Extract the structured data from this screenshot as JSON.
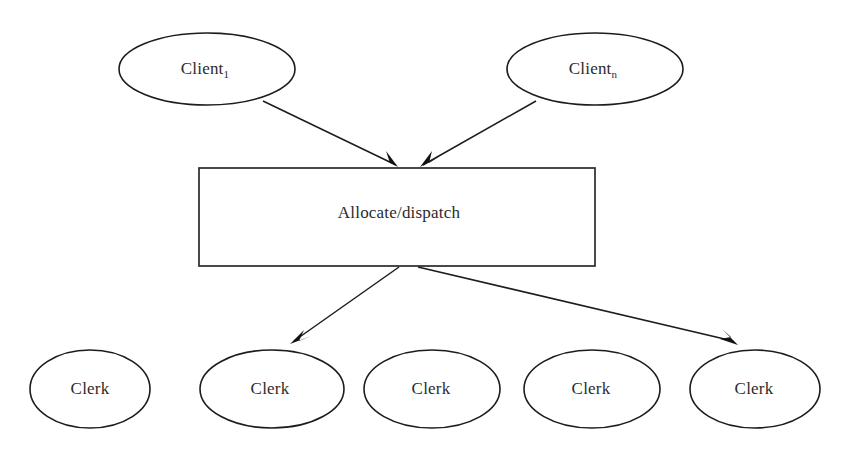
{
  "diagram": {
    "background_color": "#ffffff",
    "stroke_color": "#1c1c1c",
    "text_color": "#2b2b2b",
    "type": "flow-diagram",
    "clients": [
      {
        "id": "client-1",
        "label": "Client",
        "subscript": "1",
        "shape": "ellipse",
        "cx": 207,
        "cy": 69,
        "rx": 88,
        "ry": 36
      },
      {
        "id": "client-n",
        "label": "Client",
        "subscript": "n",
        "shape": "ellipse",
        "cx": 595,
        "cy": 69,
        "rx": 88,
        "ry": 36
      }
    ],
    "dispatcher": {
      "id": "allocate-dispatch",
      "label": "Allocate/dispatch",
      "shape": "rectangle",
      "x": 199,
      "y": 168,
      "width": 396,
      "height": 98
    },
    "clerks": [
      {
        "id": "clerk-1",
        "label": "Clerk",
        "shape": "ellipse",
        "cx": 90,
        "cy": 389,
        "rx": 60,
        "ry": 39
      },
      {
        "id": "clerk-2",
        "label": "Clerk",
        "shape": "ellipse",
        "cx": 272,
        "cy": 389,
        "rx": 72,
        "ry": 39
      },
      {
        "id": "clerk-3",
        "label": "Clerk",
        "shape": "ellipse",
        "cx": 432,
        "cy": 389,
        "rx": 68,
        "ry": 39
      },
      {
        "id": "clerk-4",
        "label": "Clerk",
        "shape": "ellipse",
        "cx": 592,
        "cy": 389,
        "rx": 68,
        "ry": 39
      },
      {
        "id": "clerk-5",
        "label": "Clerk",
        "shape": "ellipse",
        "cx": 755,
        "cy": 389,
        "rx": 65,
        "ry": 39
      }
    ],
    "edges": [
      {
        "id": "edge-client1-to-dispatch",
        "from": "client-1",
        "to": "allocate-dispatch",
        "x1": 263,
        "y1": 101,
        "x2": 398,
        "y2": 166,
        "arrow": "end"
      },
      {
        "id": "edge-clientn-to-dispatch",
        "from": "client-n",
        "to": "allocate-dispatch",
        "x1": 536,
        "y1": 101,
        "x2": 421,
        "y2": 166,
        "arrow": "end"
      },
      {
        "id": "edge-dispatch-to-clerk2",
        "from": "allocate-dispatch",
        "to": "clerk-2",
        "x1": 399,
        "y1": 267,
        "x2": 291,
        "y2": 343,
        "arrow": "end"
      },
      {
        "id": "edge-dispatch-to-clerk5",
        "from": "allocate-dispatch",
        "to": "clerk-5",
        "x1": 418,
        "y1": 267,
        "x2": 737,
        "y2": 344,
        "arrow": "end"
      }
    ]
  }
}
